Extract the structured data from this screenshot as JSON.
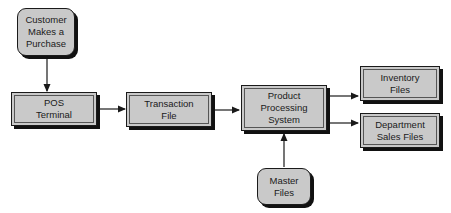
{
  "diagram": {
    "type": "flowchart",
    "nodes": [
      {
        "id": "customer",
        "label": "Customer\nMakes a\nPurchase",
        "shape": "rounded"
      },
      {
        "id": "pos",
        "label": "POS\nTerminal",
        "shape": "rectangle"
      },
      {
        "id": "transaction",
        "label": "Transaction\nFile",
        "shape": "rectangle"
      },
      {
        "id": "pps",
        "label": "Product\nProcessing\nSystem",
        "shape": "rectangle"
      },
      {
        "id": "inventory",
        "label": "Inventory\nFiles",
        "shape": "rectangle"
      },
      {
        "id": "department",
        "label": "Department\nSales Files",
        "shape": "rectangle"
      },
      {
        "id": "master",
        "label": "Master\nFiles",
        "shape": "rounded"
      }
    ],
    "edges": [
      {
        "from": "customer",
        "to": "pos"
      },
      {
        "from": "pos",
        "to": "transaction"
      },
      {
        "from": "transaction",
        "to": "pps"
      },
      {
        "from": "pps",
        "to": "inventory"
      },
      {
        "from": "pps",
        "to": "department"
      },
      {
        "from": "master",
        "to": "pps"
      }
    ],
    "colors": {
      "box_fill": "#c9c9c9",
      "stroke": "#1a1a1a",
      "shadow": "#111111"
    }
  }
}
